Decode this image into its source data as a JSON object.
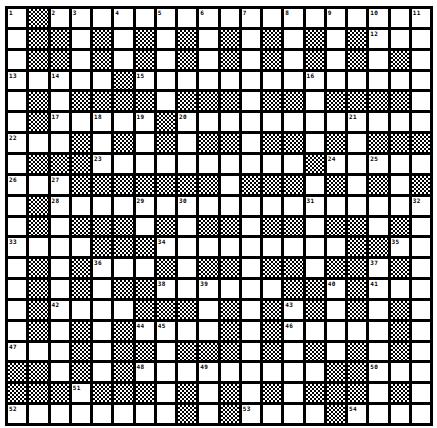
{
  "puzzle": {
    "rows": 20,
    "cols": 20,
    "colors": {
      "grid_line": "#000000",
      "cell": "#ffffff",
      "block_pattern": "checker"
    },
    "layout": [
      ".#..................",
      ".##.#.#.#.#.#.#.#...",
      ".##.#.#.#.#.#.#.#.#.",
      ".....#..............",
      ".#.####.###.##.####.",
      ".#.....#............",
      "...#.#.#.##.##.#.###",
      ".###..........#.....",
      "...#######.###.#.#.##",
      ".#..................",
      ".#.###.#.##.##.##.#.",
      "....###.........##..",
      ".#.#...#.##.##.##.#.",
      ".#.#.##......##.#...",
      ".#....###.#.#.#.#.#.",
      ".#.#.#....#.#.....#.",
      "...#.##.###.#.#.#.#.",
      "##.#.#.........##...",
      "###.###.#.#.#.###.#.",
      "........#.#....#...."
    ],
    "numbers": [
      {
        "r": 0,
        "c": 0,
        "n": "1"
      },
      {
        "r": 0,
        "c": 2,
        "n": "2"
      },
      {
        "r": 0,
        "c": 3,
        "n": "3"
      },
      {
        "r": 0,
        "c": 5,
        "n": "4"
      },
      {
        "r": 0,
        "c": 7,
        "n": "5"
      },
      {
        "r": 0,
        "c": 9,
        "n": "6"
      },
      {
        "r": 0,
        "c": 11,
        "n": "7"
      },
      {
        "r": 0,
        "c": 13,
        "n": "8"
      },
      {
        "r": 0,
        "c": 15,
        "n": "9"
      },
      {
        "r": 0,
        "c": 17,
        "n": "10"
      },
      {
        "r": 0,
        "c": 19,
        "n": "11"
      },
      {
        "r": 1,
        "c": 17,
        "n": "12"
      },
      {
        "r": 3,
        "c": 0,
        "n": "13"
      },
      {
        "r": 3,
        "c": 2,
        "n": "14"
      },
      {
        "r": 3,
        "c": 6,
        "n": "15"
      },
      {
        "r": 3,
        "c": 14,
        "n": "16"
      },
      {
        "r": 5,
        "c": 2,
        "n": "17"
      },
      {
        "r": 5,
        "c": 4,
        "n": "18"
      },
      {
        "r": 5,
        "c": 6,
        "n": "19"
      },
      {
        "r": 5,
        "c": 8,
        "n": "20"
      },
      {
        "r": 5,
        "c": 16,
        "n": "21"
      },
      {
        "r": 6,
        "c": 0,
        "n": "22"
      },
      {
        "r": 7,
        "c": 4,
        "n": "23"
      },
      {
        "r": 7,
        "c": 15,
        "n": "24"
      },
      {
        "r": 7,
        "c": 17,
        "n": "25"
      },
      {
        "r": 8,
        "c": 0,
        "n": "26"
      },
      {
        "r": 8,
        "c": 2,
        "n": "27"
      },
      {
        "r": 9,
        "c": 2,
        "n": "28"
      },
      {
        "r": 9,
        "c": 6,
        "n": "29"
      },
      {
        "r": 9,
        "c": 8,
        "n": "30"
      },
      {
        "r": 9,
        "c": 14,
        "n": "31"
      },
      {
        "r": 9,
        "c": 19,
        "n": "32"
      },
      {
        "r": 11,
        "c": 0,
        "n": "33"
      },
      {
        "r": 11,
        "c": 7,
        "n": "34"
      },
      {
        "r": 11,
        "c": 18,
        "n": "35"
      },
      {
        "r": 12,
        "c": 4,
        "n": "36"
      },
      {
        "r": 12,
        "c": 17,
        "n": "37"
      },
      {
        "r": 13,
        "c": 7,
        "n": "38"
      },
      {
        "r": 13,
        "c": 9,
        "n": "39"
      },
      {
        "r": 13,
        "c": 15,
        "n": "40"
      },
      {
        "r": 13,
        "c": 17,
        "n": "41"
      },
      {
        "r": 14,
        "c": 2,
        "n": "42"
      },
      {
        "r": 14,
        "c": 13,
        "n": "43"
      },
      {
        "r": 15,
        "c": 6,
        "n": "44"
      },
      {
        "r": 15,
        "c": 7,
        "n": "45"
      },
      {
        "r": 15,
        "c": 13,
        "n": "46"
      },
      {
        "r": 16,
        "c": 0,
        "n": "47"
      },
      {
        "r": 17,
        "c": 6,
        "n": "48"
      },
      {
        "r": 17,
        "c": 9,
        "n": "49"
      },
      {
        "r": 17,
        "c": 17,
        "n": "50"
      },
      {
        "r": 18,
        "c": 3,
        "n": "51"
      },
      {
        "r": 19,
        "c": 0,
        "n": "52"
      },
      {
        "r": 19,
        "c": 11,
        "n": "53"
      },
      {
        "r": 19,
        "c": 16,
        "n": "54"
      }
    ]
  }
}
